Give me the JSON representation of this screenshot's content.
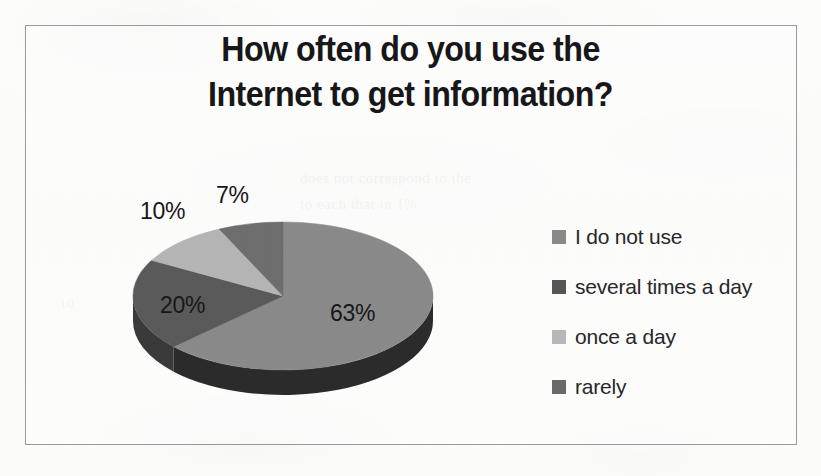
{
  "page": {
    "background_color": "#fcfcfb",
    "frame_color": "#9a9a9c"
  },
  "bleed_through": [
    {
      "text": "does not correspond to the",
      "x": 300,
      "y": 170,
      "size": 15
    },
    {
      "text": "to each that in 1%",
      "x": 300,
      "y": 196,
      "size": 15
    },
    {
      "text": "10",
      "x": 60,
      "y": 296,
      "size": 13
    }
  ],
  "chart_data": {
    "type": "pie",
    "title": "How often do you use the Internet to get information?",
    "title_lines": [
      "How often do you use the",
      "Internet to get information?"
    ],
    "xlabel": "",
    "ylabel": "",
    "grid": false,
    "legend_position": "right",
    "three_d": true,
    "categories": [
      "I do not use",
      "several times a day",
      "once a day",
      "rarely"
    ],
    "values": [
      63,
      20,
      10,
      7
    ],
    "value_labels": [
      "63%",
      "20%",
      "10%",
      "7%"
    ],
    "colors": [
      "#8a8a8a",
      "#5a5a5a",
      "#b5b5b5",
      "#6e6e6e"
    ],
    "side_colors": [
      "#2b2b2b",
      "#3a3a3a",
      "#7d7d7d",
      "#4a4a4a"
    ],
    "slices": [
      {
        "label": "I do not use",
        "value": 63,
        "value_label": "63%",
        "color": "#8a8a8a",
        "side_color": "#2b2b2b",
        "start_angle": 0,
        "end_angle": 226.8
      },
      {
        "label": "several times a day",
        "value": 20,
        "value_label": "20%",
        "color": "#5a5a5a",
        "side_color": "#3a3a3a",
        "start_angle": 226.8,
        "end_angle": 298.8
      },
      {
        "label": "once a day",
        "value": 10,
        "value_label": "10%",
        "color": "#b5b5b5",
        "side_color": "#7d7d7d",
        "start_angle": 298.8,
        "end_angle": 334.8
      },
      {
        "label": "rarely",
        "value": 7,
        "value_label": "7%",
        "color": "#6e6e6e",
        "side_color": "#4a4a4a",
        "start_angle": 334.8,
        "end_angle": 360
      }
    ]
  },
  "pie_labels": [
    {
      "text": "7%",
      "x": 108,
      "y": 12
    },
    {
      "text": "10%",
      "x": 32,
      "y": 28
    },
    {
      "text": "20%",
      "x": 52,
      "y": 122
    },
    {
      "text": "63%",
      "x": 222,
      "y": 130
    }
  ],
  "legend": {
    "items": [
      {
        "label": "I do not use",
        "color": "#8a8a8a"
      },
      {
        "label": "several times a day",
        "color": "#565656"
      },
      {
        "label": "once a day",
        "color": "#b8b8b8"
      },
      {
        "label": "rarely",
        "color": "#6a6a6a"
      }
    ]
  }
}
